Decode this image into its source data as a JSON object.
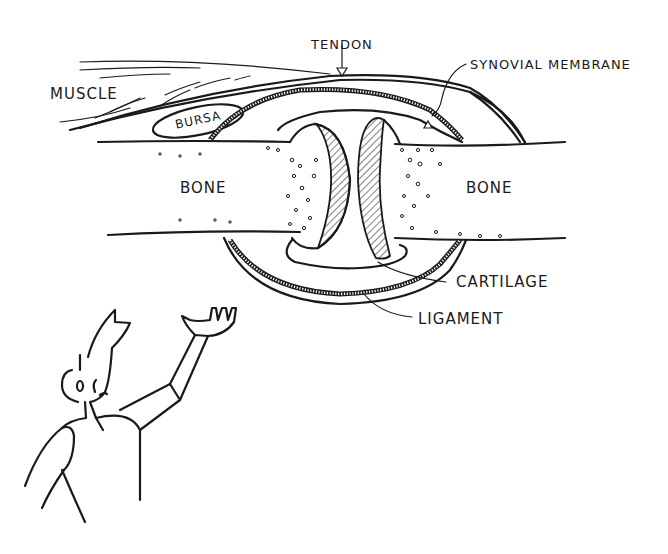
{
  "diagram": {
    "labels": {
      "tendon": "TENDON",
      "synovial_membrane": "SYNOVIAL MEMBRANE",
      "muscle": "MUSCLE",
      "bursa": "BURSA",
      "bone_left": "BONE",
      "bone_right": "BONE",
      "cartilage": "CARTILAGE",
      "ligament": "LIGAMENT"
    },
    "colors": {
      "ink": "#1a1a1a",
      "background": "#ffffff"
    }
  }
}
